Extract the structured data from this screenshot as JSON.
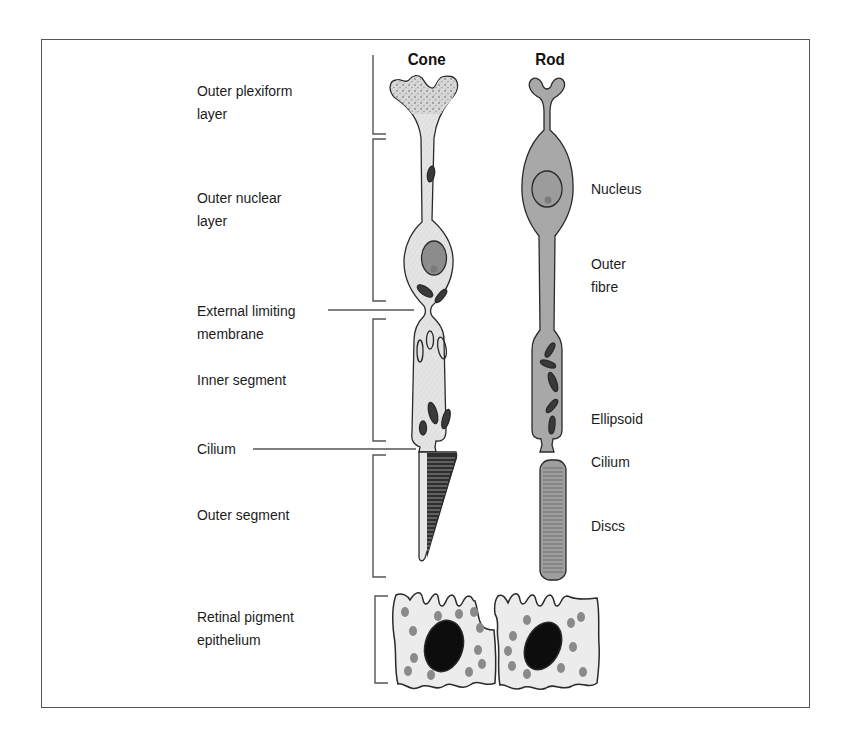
{
  "figure": {
    "cells": [
      {
        "id": "cone",
        "title": "Cone"
      },
      {
        "id": "rod",
        "title": "Rod"
      }
    ],
    "left_labels": [
      {
        "id": "outer-plexiform-layer",
        "lines": [
          "Outer plexiform",
          "layer"
        ]
      },
      {
        "id": "outer-nuclear-layer",
        "lines": [
          "Outer nuclear",
          "layer"
        ]
      },
      {
        "id": "external-limiting-membrane",
        "lines": [
          "External limiting",
          "membrane"
        ]
      },
      {
        "id": "inner-segment",
        "lines": [
          "Inner segment"
        ]
      },
      {
        "id": "cilium",
        "lines": [
          "Cilium"
        ]
      },
      {
        "id": "outer-segment",
        "lines": [
          "Outer segment"
        ]
      },
      {
        "id": "retinal-pigment-epithelium",
        "lines": [
          "Retinal pigment",
          "epithelium"
        ]
      }
    ],
    "right_labels": [
      {
        "id": "nucleus",
        "lines": [
          "Nucleus"
        ]
      },
      {
        "id": "outer-fibre",
        "lines": [
          "Outer",
          "fibre"
        ]
      },
      {
        "id": "ellipsoid",
        "lines": [
          "Ellipsoid"
        ]
      },
      {
        "id": "rod-cilium",
        "lines": [
          "Cilium"
        ]
      },
      {
        "id": "discs",
        "lines": [
          "Discs"
        ]
      }
    ],
    "colors": {
      "frame": "#555555",
      "outline": "#2a2a2a",
      "cone_fill": "#e4e4e4",
      "rod_fill": "#a8a8a8",
      "cone_nucleus": "#8c8c8c",
      "rod_nucleus": "#9c9c9c",
      "pigment_dot": "#8a8a8a",
      "rpe_nucleus": "#0d0d0d",
      "rpe_fill": "#ececec"
    }
  }
}
